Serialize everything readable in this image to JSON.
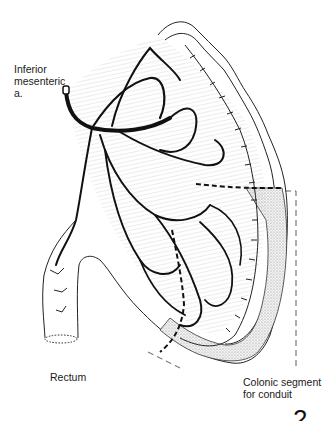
{
  "figure": {
    "labels": {
      "inferior_mesenteric": "Inferior\nmesenteric\na.",
      "rectum": "Rectum",
      "colonic_segment": "Colonic segment\nfor conduit"
    },
    "page_marker": "2",
    "colors": {
      "ink": "#111111",
      "stipple": "#bdbdbd",
      "background": "#ffffff"
    }
  }
}
